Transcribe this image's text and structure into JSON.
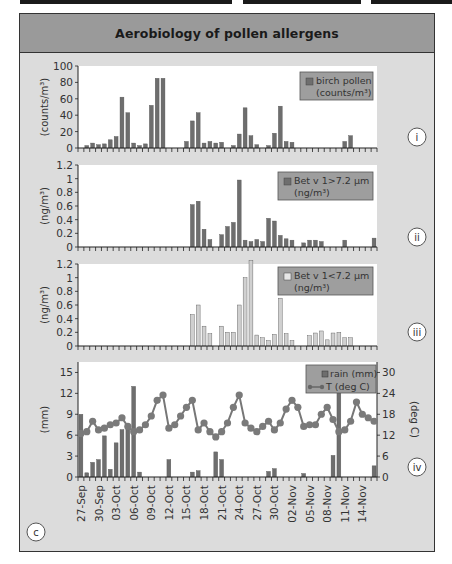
{
  "figure": {
    "title": "Aerobiology of pollen allergens",
    "panel_letter": "c"
  },
  "chart_data": [
    {
      "type": "bar",
      "panel": "i",
      "title": "",
      "ylabel": "(counts/m³)",
      "ylim": [
        0,
        100
      ],
      "yticks": [
        0,
        20,
        40,
        60,
        80,
        100
      ],
      "legend": [
        "birch pollen (counts/m³)"
      ],
      "legend_line1": "birch pollen",
      "legend_line2": "(counts/m³)",
      "bar_color": "#6e6e6e",
      "values": [
        0,
        3,
        6,
        4,
        5,
        10,
        14,
        62,
        43,
        6,
        3,
        5,
        52,
        85,
        85,
        0,
        0,
        0,
        8,
        33,
        43,
        6,
        8,
        6,
        7,
        0,
        3,
        17,
        49,
        15,
        4,
        0,
        3,
        18,
        51,
        8,
        7,
        0,
        0,
        0,
        0,
        0,
        0,
        0,
        0,
        8,
        15,
        0,
        0,
        0,
        0,
        18,
        7
      ]
    },
    {
      "type": "bar",
      "panel": "ii",
      "ylabel": "(ng/m³)",
      "ylim": [
        0,
        1.2
      ],
      "yticks": [
        0,
        0.2,
        0.4,
        0.6,
        0.8,
        1,
        1.2
      ],
      "legend": [
        "Bet v 1>7.2 µm (ng/m³)"
      ],
      "legend_line1": "Bet v 1>7.2 µm",
      "legend_line2": "(ng/m³)",
      "bar_color": "#6e6e6e",
      "values": [
        0,
        0,
        0,
        0,
        0,
        0,
        0,
        0,
        0,
        0,
        0,
        0,
        0,
        0,
        0,
        0,
        0,
        0,
        0,
        0.62,
        0.67,
        0.26,
        0.11,
        0,
        0.18,
        0.3,
        0.36,
        0.98,
        0.1,
        0.08,
        0.11,
        0.08,
        0.42,
        0.38,
        0.17,
        0.12,
        0.1,
        0,
        0.06,
        0.1,
        0.1,
        0.08,
        0,
        0,
        0,
        0.1,
        0,
        0,
        0,
        0,
        0.13,
        0.2
      ]
    },
    {
      "type": "bar",
      "panel": "iii",
      "ylabel": "(ng/m³)",
      "ylim": [
        0,
        1.2
      ],
      "yticks": [
        0,
        0.2,
        0.4,
        0.6,
        0.8,
        1,
        1.2
      ],
      "legend": [
        "Bet v 1<7.2 µm (ng/m³)"
      ],
      "legend_line1": "Bet v 1<7.2 µm",
      "legend_line2": "(ng/m³)",
      "bar_color": "#d0d0d0",
      "values": [
        0,
        0,
        0,
        0,
        0,
        0,
        0,
        0,
        0,
        0,
        0,
        0,
        0,
        0,
        0,
        0,
        0,
        0,
        0,
        0.46,
        0.6,
        0.29,
        0.18,
        0,
        0.29,
        0.2,
        0.2,
        0.6,
        1.0,
        1.25,
        0.16,
        0.12,
        0.08,
        0.17,
        0.7,
        0.18,
        0.08,
        0,
        0,
        0.15,
        0.19,
        0.22,
        0.09,
        0.19,
        0.2,
        0.12,
        0.12,
        0,
        0,
        0,
        0,
        0
      ]
    },
    {
      "type": "bar+line",
      "panel": "iv",
      "ylabel_left": "(mm)",
      "ylabel_right": "(deg C)",
      "ylim_left": [
        0,
        16.5
      ],
      "yticks_left": [
        0,
        3,
        6,
        9,
        12,
        15
      ],
      "ylim_right": [
        0,
        33
      ],
      "yticks_right": [
        0,
        6,
        12,
        18,
        24,
        30
      ],
      "legend": [
        "rain (mm)",
        "T (deg C)"
      ],
      "series": [
        {
          "name": "rain (mm)",
          "type": "bar",
          "color": "#6e6e6e",
          "values": [
            9,
            0.6,
            2.1,
            2.5,
            5.9,
            1.1,
            4.9,
            6.8,
            7,
            13,
            0.7,
            0,
            0,
            0,
            0,
            2.5,
            0,
            0,
            0,
            0.7,
            0.9,
            0,
            0,
            3.6,
            2.5,
            0,
            0,
            0,
            0,
            0,
            0,
            0,
            0.8,
            1.2,
            0,
            0,
            0,
            0,
            0.5,
            0,
            0,
            0,
            0,
            3.1,
            13.3,
            0,
            0,
            0,
            0,
            0,
            1.6,
            0.5,
            0.5,
            0,
            0
          ]
        },
        {
          "name": "T (deg C)",
          "type": "line",
          "color": "#777777",
          "values": [
            12.5,
            13,
            16,
            13.5,
            14,
            15,
            15.5,
            17,
            14.5,
            13,
            13.5,
            15,
            17.5,
            22,
            23.5,
            14,
            15,
            17.5,
            20,
            22,
            13.5,
            15.5,
            13,
            11.5,
            13,
            15.5,
            20,
            23.5,
            15.5,
            14,
            13,
            14.5,
            16,
            13.5,
            15.5,
            19.5,
            22,
            20,
            14.5,
            15,
            15,
            18,
            20,
            16.5,
            13,
            13.5,
            16,
            21.5,
            18,
            17,
            16
          ]
        }
      ]
    }
  ],
  "x_axis": {
    "start_date": "27-Sep",
    "tick_labels": [
      "27-Sep",
      "30-Sep",
      "03-Oct",
      "06-Oct",
      "09-Oct",
      "12-Oct",
      "15-Oct",
      "18-Oct",
      "21-Oct",
      "24-Oct",
      "27-Oct",
      "30-Oct",
      "02-Nov",
      "05-Nov",
      "08-Nov",
      "11-Nov",
      "14-Nov"
    ]
  },
  "panel_markers": [
    "i",
    "ii",
    "iii",
    "iv"
  ]
}
